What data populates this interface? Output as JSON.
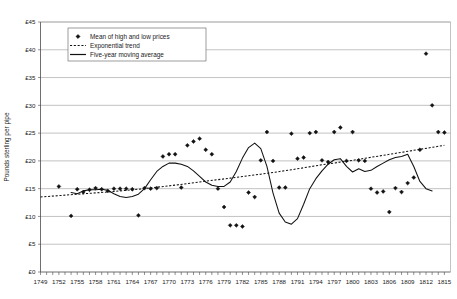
{
  "chart_data": {
    "type": "scatter",
    "title": "",
    "subtitle": "",
    "xlabel": "",
    "ylabel": "Pounds sterling per pipe",
    "xlim": [
      1749,
      1816
    ],
    "ylim": [
      0,
      45
    ],
    "y_tick_step": 5,
    "y_ticks": [
      "£0",
      "£5",
      "£10",
      "£15",
      "£20",
      "£25",
      "£30",
      "£35",
      "£40",
      "£45"
    ],
    "y_tick_values": [
      0,
      5,
      10,
      15,
      20,
      25,
      30,
      35,
      40,
      45
    ],
    "x_ticks": [
      "1749",
      "1752",
      "1755",
      "1758",
      "1761",
      "1764",
      "1767",
      "1770",
      "1773",
      "1776",
      "1779",
      "1782",
      "1785",
      "1788",
      "1791",
      "1794",
      "1797",
      "1800",
      "1803",
      "1806",
      "1809",
      "1812",
      "1815"
    ],
    "x_tick_values": [
      1749,
      1752,
      1755,
      1758,
      1761,
      1764,
      1767,
      1770,
      1773,
      1776,
      1779,
      1782,
      1785,
      1788,
      1791,
      1794,
      1797,
      1800,
      1803,
      1806,
      1809,
      1812,
      1815
    ],
    "x_tick_interval": 3,
    "x_minor_interval": 1,
    "grid": "horizontal",
    "legend_position": "top-left-inside",
    "series": [
      {
        "name": "Mean of high and low prices",
        "type": "scatter",
        "marker": "diamond",
        "color": "#111111",
        "x": [
          1752,
          1754,
          1755,
          1756,
          1757,
          1758,
          1759,
          1760,
          1761,
          1762,
          1763,
          1764,
          1765,
          1766,
          1767,
          1768,
          1769,
          1770,
          1771,
          1772,
          1773,
          1774,
          1775,
          1776,
          1777,
          1778,
          1779,
          1780,
          1781,
          1782,
          1783,
          1784,
          1785,
          1786,
          1787,
          1788,
          1789,
          1790,
          1791,
          1792,
          1793,
          1794,
          1795,
          1796,
          1797,
          1798,
          1799,
          1800,
          1801,
          1802,
          1803,
          1804,
          1805,
          1806,
          1807,
          1808,
          1809,
          1810,
          1811,
          1812,
          1813,
          1814,
          1815
        ],
        "y": [
          15.4,
          10.1,
          14.9,
          14.4,
          14.8,
          15.1,
          14.9,
          14.6,
          15.0,
          15.0,
          15.0,
          14.9,
          10.2,
          15.1,
          15.0,
          15.1,
          20.8,
          21.2,
          21.2,
          15.2,
          22.8,
          23.5,
          24.0,
          22.0,
          21.2,
          15.0,
          11.7,
          8.4,
          8.4,
          8.2,
          14.3,
          13.5,
          20.1,
          25.2,
          20.0,
          15.2,
          15.2,
          24.9,
          20.4,
          20.6,
          25.0,
          25.2,
          20.1,
          19.8,
          25.2,
          26.0,
          20.0,
          25.2,
          20.1,
          20.0,
          15.0,
          14.3,
          14.5,
          10.8,
          15.1,
          14.4,
          16.0,
          17.0,
          22.0,
          39.3,
          30.0,
          25.2,
          25.1
        ]
      },
      {
        "name": "Exponential trend",
        "type": "line",
        "style": "dashed",
        "color": "#111111",
        "x": [
          1749,
          1755,
          1760,
          1765,
          1770,
          1775,
          1780,
          1785,
          1790,
          1795,
          1800,
          1805,
          1810,
          1815
        ],
        "y": [
          13.5,
          14.0,
          14.4,
          14.9,
          15.5,
          16.2,
          16.9,
          17.6,
          18.4,
          19.3,
          20.1,
          21.0,
          21.9,
          22.8
        ]
      },
      {
        "name": "Five-year moving average",
        "type": "line",
        "style": "solid",
        "color": "#111111",
        "x": [
          1754,
          1755,
          1756,
          1757,
          1758,
          1759,
          1760,
          1761,
          1762,
          1763,
          1764,
          1765,
          1766,
          1767,
          1768,
          1769,
          1770,
          1771,
          1772,
          1773,
          1774,
          1775,
          1776,
          1777,
          1778,
          1779,
          1780,
          1781,
          1782,
          1783,
          1784,
          1785,
          1786,
          1787,
          1788,
          1789,
          1790,
          1791,
          1792,
          1793,
          1794,
          1795,
          1796,
          1797,
          1798,
          1799,
          1800,
          1801,
          1802,
          1803,
          1804,
          1805,
          1806,
          1807,
          1808,
          1809,
          1810,
          1811,
          1812,
          1813
        ],
        "y": [
          14.3,
          14.1,
          14.6,
          14.8,
          14.8,
          14.9,
          14.7,
          14.1,
          13.6,
          13.4,
          13.6,
          14.0,
          15.0,
          16.6,
          18.1,
          19.0,
          19.6,
          19.6,
          19.4,
          19.0,
          18.2,
          17.2,
          16.2,
          15.6,
          15.4,
          15.4,
          16.2,
          18.1,
          20.5,
          22.4,
          23.2,
          22.2,
          19.0,
          14.2,
          10.6,
          9.0,
          8.6,
          9.6,
          12.2,
          15.0,
          16.8,
          18.2,
          19.4,
          20.2,
          20.4,
          19.0,
          18.0,
          18.6,
          18.1,
          18.3,
          19.0,
          19.6,
          20.2,
          20.6,
          20.8,
          21.2,
          19.0,
          16.3,
          15.0,
          14.6
        ]
      }
    ],
    "legend": [
      {
        "label": "Mean of high and low prices",
        "marker": "diamond"
      },
      {
        "label": "Exponential trend",
        "marker": "dashed-line"
      },
      {
        "label": "Five-year moving average",
        "marker": "solid-line"
      }
    ]
  }
}
